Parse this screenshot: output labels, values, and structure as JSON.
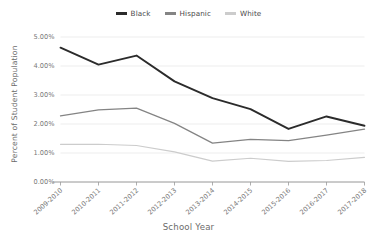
{
  "chart_data": {
    "type": "line",
    "title": "",
    "xlabel": "School Year",
    "ylabel": "Percent of Student Population",
    "categories": [
      "2009-2010",
      "2010-2011",
      "2011-2012",
      "2012-2013",
      "2013-2014",
      "2014-2015",
      "2015-2016",
      "2016-2017",
      "2017-2018"
    ],
    "ylim": [
      0,
      5
    ],
    "yticks": [
      0,
      1,
      2,
      3,
      4,
      5
    ],
    "ytick_labels": [
      "0.00%",
      "1.00%",
      "2.00%",
      "3.00%",
      "4.00%",
      "5.00%"
    ],
    "grid": true,
    "legend_position": "top-center",
    "series": [
      {
        "name": "Black",
        "color": "#2b2b2b",
        "values": [
          4.63,
          4.05,
          4.36,
          3.47,
          2.89,
          2.51,
          1.83,
          2.26,
          1.94
        ]
      },
      {
        "name": "Hispanic",
        "color": "#848484",
        "values": [
          2.28,
          2.49,
          2.55,
          2.02,
          1.34,
          1.47,
          1.43,
          1.62,
          1.82
        ]
      },
      {
        "name": "White",
        "color": "#cccccc",
        "values": [
          1.3,
          1.3,
          1.26,
          1.04,
          0.72,
          0.82,
          0.71,
          0.74,
          0.85
        ]
      }
    ]
  },
  "legend": {
    "items": [
      {
        "label": "Black",
        "color": "#2b2b2b"
      },
      {
        "label": "Hispanic",
        "color": "#848484"
      },
      {
        "label": "White",
        "color": "#cccccc"
      }
    ]
  },
  "axes": {
    "y_title": "Percent of Student Population",
    "x_title": "School Year"
  }
}
